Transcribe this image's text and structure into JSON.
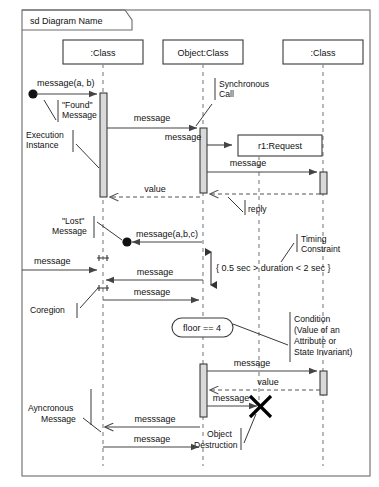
{
  "diagram": {
    "type": "uml-sequence-diagram",
    "frame_label": "sd Diagram Name",
    "lifelines": [
      {
        "id": "ll1",
        "label": ":Class",
        "x": 103
      },
      {
        "id": "ll2",
        "label": "Object:Class",
        "x": 203
      },
      {
        "id": "ll3",
        "label": ":Class",
        "x": 323
      },
      {
        "id": "ll4",
        "label": "r1:Request",
        "x": 259
      }
    ],
    "messages": [
      {
        "id": "m1",
        "label": "message(a, b)",
        "kind": "found"
      },
      {
        "id": "m2",
        "label": "message",
        "kind": "synchronous"
      },
      {
        "id": "m3",
        "label": "message",
        "kind": "synchronous"
      },
      {
        "id": "m4",
        "label": "message",
        "kind": "synchronous"
      },
      {
        "id": "m5",
        "label": "value",
        "kind": "reply"
      },
      {
        "id": "m6",
        "label": "reply",
        "kind": "reply-annotation"
      },
      {
        "id": "m7",
        "label": "message(a,b,c)",
        "kind": "lost"
      },
      {
        "id": "m8",
        "label": "message",
        "kind": "synchronous"
      },
      {
        "id": "m9",
        "label": "message",
        "kind": "synchronous"
      },
      {
        "id": "m10",
        "label": "message",
        "kind": "synchronous"
      },
      {
        "id": "m11",
        "label": "message",
        "kind": "synchronous"
      },
      {
        "id": "m12",
        "label": "value",
        "kind": "reply"
      },
      {
        "id": "m13",
        "label": "message",
        "kind": "synchronous"
      },
      {
        "id": "m14",
        "label": "messsage",
        "kind": "asynchronous"
      },
      {
        "id": "m15",
        "label": "message",
        "kind": "synchronous"
      }
    ],
    "annotations": [
      {
        "id": "a1",
        "lines": [
          "\"Found\"",
          "Message"
        ]
      },
      {
        "id": "a2",
        "lines": [
          "Execution",
          "Instance"
        ]
      },
      {
        "id": "a3",
        "lines": [
          "Synchronous",
          "Call"
        ]
      },
      {
        "id": "a4",
        "lines": [
          "reply"
        ]
      },
      {
        "id": "a5",
        "lines": [
          "\"Lost\"",
          "Message"
        ]
      },
      {
        "id": "a6",
        "lines": [
          "Coregion"
        ]
      },
      {
        "id": "a7",
        "lines": [
          "Timing",
          "Constraint"
        ]
      },
      {
        "id": "a8",
        "lines": [
          "Condition",
          "(Value of an",
          "Attribute or",
          "State Invariant)"
        ]
      },
      {
        "id": "a9",
        "lines": [
          "Ayncronous",
          "Message"
        ]
      },
      {
        "id": "a10",
        "lines": [
          "Object",
          "Destruction"
        ]
      }
    ],
    "constraints": [
      {
        "id": "c1",
        "text": "{ 0.5 sec > duration < 2 sec }",
        "kind": "timing-constraint"
      }
    ],
    "state_invariants": [
      {
        "id": "s1",
        "text": "floor == 4",
        "kind": "condition"
      }
    ],
    "labels": {
      "frame": "sd Diagram Name",
      "class1": ":Class",
      "class2": "Object:Class",
      "class3": ":Class",
      "request": "r1:Request",
      "message_ab": "message(a, b)",
      "message_abc": "message(a,b,c)",
      "message": "message",
      "messsage": "messsage",
      "value": "value",
      "reply": "reply",
      "found1": "\"Found\"",
      "found2": "Message",
      "exec1": "Execution",
      "exec2": "Instance",
      "sync1": "Synchronous",
      "sync2": "Call",
      "lost1": "\"Lost\"",
      "lost2": "Message",
      "coregion": "Coregion",
      "timing1": "Timing",
      "timing2": "Constraint",
      "timing_constraint": "{ 0.5 sec > duration < 2 sec }",
      "condition_state": "floor == 4",
      "cond1": "Condition",
      "cond2": "(Value of an",
      "cond3": "Attribute or",
      "cond4": "State Invariant)",
      "async1": "Ayncronous",
      "async2": "Message",
      "destroy1": "Object",
      "destroy2": "Destruction"
    },
    "colors": {
      "background": "#ffffff",
      "frame_stroke": "#6a6a6a",
      "box_stroke": "#3a3a3a",
      "lifeline_stroke": "#8a8a8a",
      "activation_fill": "#d9d9d9",
      "message_stroke": "#444444",
      "text": "#111111"
    }
  }
}
